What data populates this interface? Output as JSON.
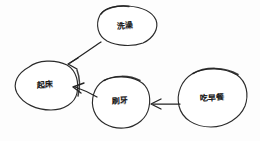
{
  "diagram": {
    "style": "hand-drawn sketch",
    "background_color": "#fdfdfd",
    "ink_color": "#232323",
    "nodes": [
      {
        "id": "shower",
        "label": "洗澡",
        "shape": "ellipse",
        "cx": 125,
        "cy": 26,
        "rx": 31,
        "ry": 20,
        "label_x": 125,
        "label_y": 26
      },
      {
        "id": "get-up",
        "label": "起床",
        "shape": "ellipse",
        "cx": 46,
        "cy": 85,
        "rx": 32,
        "ry": 25,
        "label_x": 45,
        "label_y": 85
      },
      {
        "id": "brush-teeth",
        "label": "刷牙",
        "shape": "ellipse",
        "cx": 121,
        "cy": 102,
        "rx": 29,
        "ry": 26,
        "label_x": 120,
        "label_y": 101
      },
      {
        "id": "breakfast",
        "label": "吃早餐",
        "shape": "ellipse",
        "cx": 213,
        "cy": 98,
        "rx": 35,
        "ry": 30,
        "label_x": 212,
        "label_y": 98
      }
    ],
    "edges": [
      {
        "id": "shower-to-get-up",
        "from": "shower",
        "to": "get-up",
        "direction": "down-left",
        "arrowhead": "to"
      },
      {
        "id": "brush-teeth-to-get-up",
        "from": "brush-teeth",
        "to": "get-up",
        "direction": "left",
        "arrowhead": "to"
      },
      {
        "id": "breakfast-to-brush-teeth",
        "from": "breakfast",
        "to": "brush-teeth",
        "direction": "left",
        "arrowhead": "to"
      }
    ]
  }
}
